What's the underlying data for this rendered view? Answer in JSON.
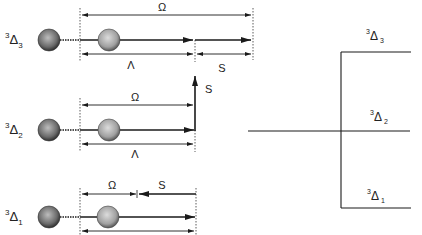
{
  "left_panel": {
    "rows": [
      {
        "state": {
          "sup": "3",
          "base": "Δ",
          "sub": "3"
        },
        "top_label": "Ω",
        "bottom_label": "Λ",
        "extra_label": "S",
        "description": "Λ and S parallel, Ω = Λ + S"
      },
      {
        "state": {
          "sup": "3",
          "base": "Δ",
          "sub": "2"
        },
        "top_label": "Ω",
        "bottom_label": "Λ",
        "extra_label": "S",
        "description": "S perpendicular, Ω = Λ"
      },
      {
        "state": {
          "sup": "3",
          "base": "Δ",
          "sub": "1"
        },
        "top_label": "Ω",
        "extra_label": "S",
        "description": "S antiparallel, Ω = Λ − S"
      }
    ]
  },
  "right_panel": {
    "levels": [
      {
        "sup": "3",
        "base": "Δ",
        "sub": "3"
      },
      {
        "sup": "3",
        "base": "Δ",
        "sub": "2"
      },
      {
        "sup": "3",
        "base": "Δ",
        "sub": "1"
      }
    ]
  },
  "colors": {
    "line": "#1a1a1a",
    "sphere_dark": "#555555",
    "sphere_light": "#a8a8a8"
  }
}
